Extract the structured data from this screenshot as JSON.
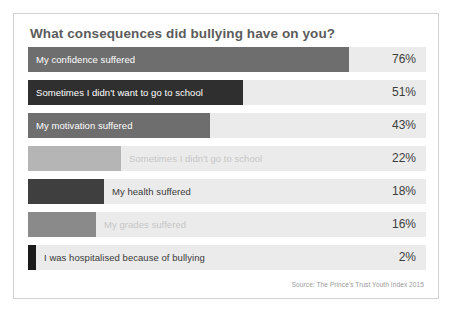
{
  "chart_data": {
    "type": "bar",
    "title": "What consequences did bullying have on you?",
    "xlabel": "",
    "ylabel": "",
    "xlim": [
      0,
      100
    ],
    "grid": false,
    "legend": null,
    "orientation": "horizontal",
    "unit": "%",
    "source": "Source: The Prince's Trust Youth Index 2015",
    "categories": [
      "My confidence suffered",
      "Sometimes I didn't want to go to school",
      "My motivation suffered",
      "Sometimes I didn't go to school",
      "My health suffered",
      "My grades suffered",
      "I was hospitalised because of bullying"
    ],
    "values": [
      76,
      51,
      43,
      22,
      18,
      16,
      2
    ],
    "value_labels": [
      "76%",
      "51%",
      "43%",
      "22%",
      "18%",
      "16%",
      "2%"
    ],
    "bars": [
      {
        "label": "My confidence suffered",
        "value": 76,
        "value_label": "76%",
        "color": "#6e6e6e",
        "label_placement": "inside",
        "label_color": "#ffffff"
      },
      {
        "label": "Sometimes I didn't want to go to school",
        "value": 51,
        "value_label": "51%",
        "color": "#2f2f2f",
        "label_placement": "inside",
        "label_color": "#ffffff"
      },
      {
        "label": "My motivation suffered",
        "value": 43,
        "value_label": "43%",
        "color": "#6e6e6e",
        "label_placement": "inside",
        "label_color": "#ffffff"
      },
      {
        "label": "Sometimes I didn't go to school",
        "value": 22,
        "value_label": "22%",
        "color": "#b5b5b5",
        "label_placement": "outside-light",
        "label_color": "#c6c6c6"
      },
      {
        "label": "My health suffered",
        "value": 18,
        "value_label": "18%",
        "color": "#3f3f3f",
        "label_placement": "outside-dark",
        "label_color": "#3a3a3a"
      },
      {
        "label": "My grades suffered",
        "value": 16,
        "value_label": "16%",
        "color": "#8a8a8a",
        "label_placement": "outside-light",
        "label_color": "#c6c6c6"
      },
      {
        "label": "I was hospitalised because of bullying",
        "value": 2,
        "value_label": "2%",
        "color": "#1a1a1a",
        "label_placement": "outside-dark",
        "label_color": "#3a3a3a"
      }
    ],
    "track_color": "#ebebeb",
    "card_border_color": "#d2d2d2",
    "title_color": "#5b5b5b",
    "value_color": "#3d3d3d",
    "source_color": "#9a9a9a"
  }
}
